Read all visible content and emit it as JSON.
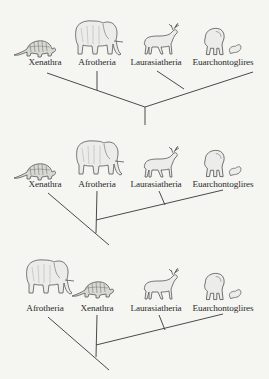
{
  "diagram": {
    "title": "",
    "colors": {
      "background": "#f5f5f2",
      "line": "#4a4a4a",
      "text": "#2b2b2b",
      "animal": "#555555"
    },
    "panels": [
      {
        "id": "hypothesis-1",
        "description": "Xenathra and Afrotheria form one clade; Laurasiatheria and Euarchontoglires form another",
        "taxa": [
          {
            "label": "Xenathra",
            "animal": "armadillo-icon"
          },
          {
            "label": "Afrotheria",
            "animal": "elephant-icon"
          },
          {
            "label": "Laurasiatheria",
            "animal": "reindeer-icon"
          },
          {
            "label": "Euarchontoglires",
            "animal": "gorilla-and-rodent-icon"
          }
        ]
      },
      {
        "id": "hypothesis-2",
        "description": "Xenathra is the basal branch; Afrotheria sister to (Laurasiatheria + Euarchontoglires)",
        "taxa": [
          {
            "label": "Xenathra",
            "animal": "armadillo-icon"
          },
          {
            "label": "Afrotheria",
            "animal": "elephant-icon"
          },
          {
            "label": "Laurasiatheria",
            "animal": "reindeer-icon"
          },
          {
            "label": "Euarchontoglires",
            "animal": "gorilla-and-rodent-icon"
          }
        ]
      },
      {
        "id": "hypothesis-3",
        "description": "Afrotheria is the basal branch; Xenathra sister to (Laurasiatheria + Euarchontoglires)",
        "taxa": [
          {
            "label": "Afrotheria",
            "animal": "elephant-icon"
          },
          {
            "label": "Xenathra",
            "animal": "armadillo-icon"
          },
          {
            "label": "Laurasiatheria",
            "animal": "reindeer-icon"
          },
          {
            "label": "Euarchontoglires",
            "animal": "gorilla-and-rodent-icon"
          }
        ]
      }
    ]
  }
}
